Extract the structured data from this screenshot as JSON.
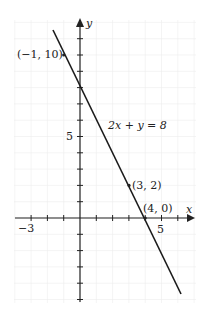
{
  "chart_data": {
    "type": "line",
    "title": "",
    "xlabel": "x",
    "ylabel": "y",
    "xlim": [
      -4,
      7
    ],
    "ylim": [
      -5,
      12
    ],
    "grid": true,
    "tick_labels": {
      "x": [
        "-3",
        "5"
      ],
      "y": [
        "5"
      ]
    },
    "series": [
      {
        "name": "2x + y = 8",
        "equation": "2x+y=8",
        "x": [
          -1.65,
          6.2
        ],
        "y": [
          11.3,
          -4.4
        ]
      }
    ],
    "points": [
      {
        "label": "(−1, 10)",
        "x": -1,
        "y": 10
      },
      {
        "label": "(3, 2)",
        "x": 3,
        "y": 2
      },
      {
        "label": "(4, 0)",
        "x": 4,
        "y": 0
      }
    ],
    "annotations": [
      {
        "text": "2x + y = 8",
        "x": 2.3,
        "y": 6
      }
    ]
  },
  "labels": {
    "x_axis": "x",
    "y_axis": "y",
    "tick_neg3": "−3",
    "tick_x5": "5",
    "tick_y5": "5",
    "pt1": "(−1, 10)",
    "pt2": "(3, 2)",
    "pt3": "(4, 0)",
    "equation": "2x + y = 8"
  }
}
